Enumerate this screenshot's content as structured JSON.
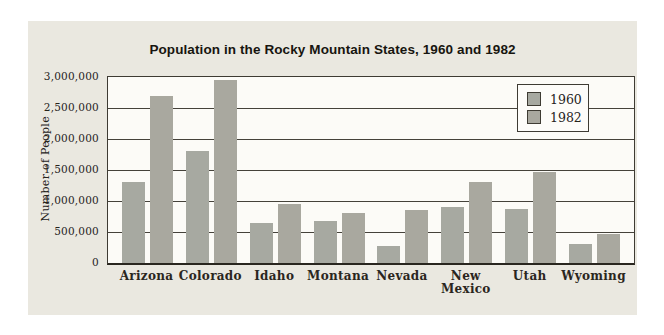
{
  "chart_data": {
    "type": "bar",
    "title": "Population in the Rocky Mountain States, 1960 and 1982",
    "ylabel": "Number of People",
    "xlabel": "",
    "categories": [
      "Arizona",
      "Colorado",
      "Idaho",
      "Montana",
      "Nevada",
      "New Mexico",
      "Utah",
      "Wyoming"
    ],
    "series": [
      {
        "name": "1960",
        "color": "#a7a9a1",
        "values": [
          1300000,
          1800000,
          650000,
          675000,
          275000,
          900000,
          875000,
          300000
        ]
      },
      {
        "name": "1982",
        "color": "#a9a89f",
        "values": [
          2700000,
          2950000,
          950000,
          800000,
          850000,
          1300000,
          1475000,
          475000
        ]
      }
    ],
    "ylim": [
      0,
      3000000
    ],
    "ytick_step": 500000,
    "yticks": [
      0,
      500000,
      1000000,
      1500000,
      2000000,
      2500000,
      3000000
    ],
    "ytick_labels": [
      "0",
      "500,000",
      "1,000,000",
      "1,500,000",
      "2,000,000",
      "2,500,000",
      "3,000,000"
    ],
    "grid": true,
    "legend_position": "top-right",
    "colors": {
      "panel_background": "#eae8e0",
      "plot_background": "#fcfbf7",
      "axis_line": "#3e3b33",
      "grid_line": "#45423a",
      "text": "#26231c"
    }
  }
}
